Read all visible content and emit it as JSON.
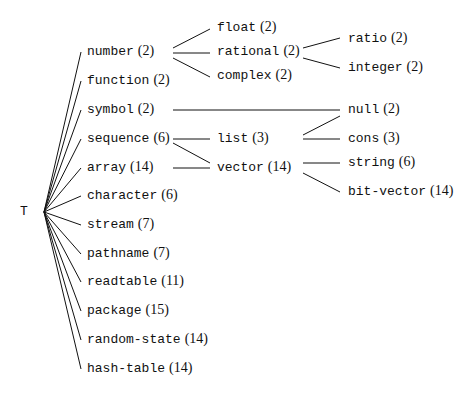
{
  "diagram": {
    "type": "type-hierarchy-tree",
    "root": {
      "label": "T",
      "x": 20,
      "y": 205
    },
    "nodes": [
      {
        "id": "number",
        "name": "number",
        "count": "(2)",
        "x": 87,
        "y": 44,
        "parent": "T"
      },
      {
        "id": "function",
        "name": "function",
        "count": "(2)",
        "x": 87,
        "y": 73,
        "parent": "T"
      },
      {
        "id": "symbol",
        "name": "symbol",
        "count": "(2)",
        "x": 87,
        "y": 102,
        "parent": "T"
      },
      {
        "id": "sequence",
        "name": "sequence",
        "count": "(6)",
        "x": 87,
        "y": 131,
        "parent": "T"
      },
      {
        "id": "array",
        "name": "array",
        "count": "(14)",
        "x": 87,
        "y": 160,
        "parent": "T"
      },
      {
        "id": "character",
        "name": "character",
        "count": "(6)",
        "x": 87,
        "y": 188,
        "parent": "T"
      },
      {
        "id": "stream",
        "name": "stream",
        "count": "(7)",
        "x": 87,
        "y": 217,
        "parent": "T"
      },
      {
        "id": "pathname",
        "name": "pathname",
        "count": "(7)",
        "x": 87,
        "y": 246,
        "parent": "T"
      },
      {
        "id": "readtable",
        "name": "readtable",
        "count": "(11)",
        "x": 87,
        "y": 274,
        "parent": "T"
      },
      {
        "id": "package",
        "name": "package",
        "count": "(15)",
        "x": 87,
        "y": 303,
        "parent": "T"
      },
      {
        "id": "random-state",
        "name": "random-state",
        "count": "(14)",
        "x": 87,
        "y": 332,
        "parent": "T"
      },
      {
        "id": "hash-table",
        "name": "hash-table",
        "count": "(14)",
        "x": 87,
        "y": 361,
        "parent": "T"
      },
      {
        "id": "float",
        "name": "float",
        "count": "(2)",
        "x": 217,
        "y": 20,
        "parent": "number"
      },
      {
        "id": "rational",
        "name": "rational",
        "count": "(2)",
        "x": 217,
        "y": 44,
        "parent": "number"
      },
      {
        "id": "complex",
        "name": "complex",
        "count": "(2)",
        "x": 217,
        "y": 68,
        "parent": "number"
      },
      {
        "id": "list",
        "name": "list",
        "count": "(3)",
        "x": 217,
        "y": 131,
        "parent": "sequence"
      },
      {
        "id": "vector",
        "name": "vector",
        "count": "(14)",
        "x": 217,
        "y": 160,
        "parent": "sequence, array"
      },
      {
        "id": "ratio",
        "name": "ratio",
        "count": "(2)",
        "x": 348,
        "y": 31,
        "parent": "rational"
      },
      {
        "id": "integer",
        "name": "integer",
        "count": "(2)",
        "x": 348,
        "y": 60,
        "parent": "rational"
      },
      {
        "id": "null",
        "name": "null",
        "count": "(2)",
        "x": 348,
        "y": 102,
        "parent": "symbol, list"
      },
      {
        "id": "cons",
        "name": "cons",
        "count": "(3)",
        "x": 348,
        "y": 131,
        "parent": "list"
      },
      {
        "id": "string",
        "name": "string",
        "count": "(6)",
        "x": 348,
        "y": 155,
        "parent": "vector"
      },
      {
        "id": "bit-vector",
        "name": "bit-vector",
        "count": "(14)",
        "x": 348,
        "y": 184,
        "parent": "vector"
      }
    ],
    "edges": [
      [
        44,
        212,
        81,
        52
      ],
      [
        44,
        212,
        81,
        81
      ],
      [
        44,
        212,
        81,
        110
      ],
      [
        44,
        212,
        81,
        139
      ],
      [
        44,
        212,
        81,
        168
      ],
      [
        44,
        212,
        81,
        196
      ],
      [
        44,
        212,
        81,
        225
      ],
      [
        44,
        212,
        81,
        254
      ],
      [
        44,
        212,
        81,
        282
      ],
      [
        44,
        212,
        81,
        311
      ],
      [
        44,
        212,
        81,
        340
      ],
      [
        44,
        212,
        81,
        369
      ],
      [
        173,
        48,
        210,
        29
      ],
      [
        173,
        53,
        210,
        53
      ],
      [
        173,
        58,
        210,
        77
      ],
      [
        173,
        110,
        340,
        110
      ],
      [
        173,
        139,
        210,
        139
      ],
      [
        173,
        143,
        210,
        163
      ],
      [
        173,
        168,
        210,
        168
      ],
      [
        303,
        48,
        340,
        38
      ],
      [
        303,
        58,
        340,
        68
      ],
      [
        303,
        135,
        340,
        116
      ],
      [
        303,
        139,
        340,
        139
      ],
      [
        303,
        163,
        340,
        163
      ],
      [
        303,
        173,
        340,
        192
      ]
    ]
  }
}
